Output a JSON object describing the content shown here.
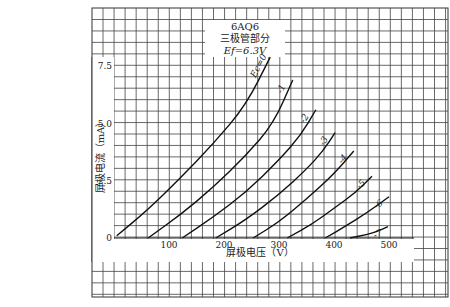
{
  "chart_data": {
    "type": "line",
    "title": "6AQ6",
    "subtitle": "三极管部分",
    "condition": "Ef=6.3V",
    "xlabel": "屏极电压（V）",
    "ylabel": "屏极电流（mA）",
    "xlim": [
      0,
      500
    ],
    "ylim": [
      0,
      7.5
    ],
    "x_ticks": [
      "100",
      "200",
      "300",
      "400",
      "500"
    ],
    "y_ticks": [
      "0",
      "2.5",
      "5.0",
      "7.5"
    ],
    "grid": true,
    "legend_position": "inline labels at curve ends",
    "series": [
      {
        "name": "Ec=0",
        "label": "Ec=0",
        "points": [
          [
            5,
            0.1
          ],
          [
            60,
            1.2
          ],
          [
            120,
            2.6
          ],
          [
            180,
            4.1
          ],
          [
            240,
            5.8
          ],
          [
            284,
            7.9
          ]
        ]
      },
      {
        "name": "Ec=-1",
        "label": "-1",
        "points": [
          [
            62,
            0
          ],
          [
            120,
            1.0
          ],
          [
            180,
            2.2
          ],
          [
            240,
            3.6
          ],
          [
            290,
            5.0
          ],
          [
            325,
            6.9
          ]
        ]
      },
      {
        "name": "Ec=-2",
        "label": "-2",
        "points": [
          [
            124,
            0
          ],
          [
            180,
            0.9
          ],
          [
            240,
            2.0
          ],
          [
            300,
            3.4
          ],
          [
            340,
            4.5
          ],
          [
            367,
            5.6
          ]
        ]
      },
      {
        "name": "Ec=-3",
        "label": "-3",
        "points": [
          [
            185,
            0
          ],
          [
            240,
            0.8
          ],
          [
            300,
            1.9
          ],
          [
            350,
            3.0
          ],
          [
            380,
            3.8
          ],
          [
            402,
            4.6
          ]
        ]
      },
      {
        "name": "Ec=-4",
        "label": "-4",
        "points": [
          [
            253,
            0
          ],
          [
            300,
            0.7
          ],
          [
            350,
            1.7
          ],
          [
            400,
            2.8
          ],
          [
            436,
            3.8
          ]
        ]
      },
      {
        "name": "Ec=-5",
        "label": "-5",
        "points": [
          [
            315,
            0
          ],
          [
            360,
            0.6
          ],
          [
            400,
            1.3
          ],
          [
            440,
            2.0
          ],
          [
            469,
            2.7
          ]
        ]
      },
      {
        "name": "Ec=-6",
        "label": "-6",
        "points": [
          [
            384,
            0
          ],
          [
            420,
            0.5
          ],
          [
            460,
            1.1
          ],
          [
            500,
            1.8
          ]
        ]
      },
      {
        "name": "Ec=-7",
        "label": "-7",
        "points": [
          [
            429,
            0
          ],
          [
            460,
            0.15
          ],
          [
            480,
            0.3
          ],
          [
            498,
            0.5
          ]
        ]
      }
    ]
  }
}
